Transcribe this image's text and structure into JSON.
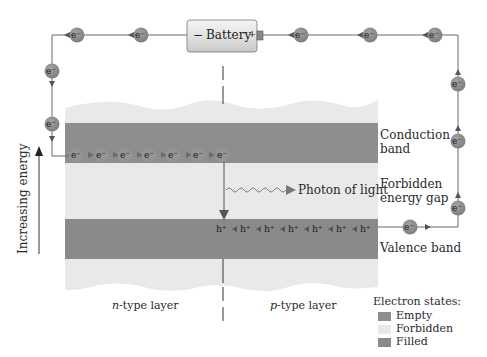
{
  "colors": {
    "empty_band": "#8e8e8e",
    "forbidden": "#e9e9e9",
    "filled_band": "#8a8a8a",
    "particle": "#8f8f8f",
    "wire": "#6a6a6a",
    "battery_body": "#e4e4e4"
  },
  "battery": {
    "label": "Battery",
    "negative": "−",
    "positive": "+"
  },
  "circuit": {
    "electron_symbol": "e⁻",
    "top_wire_electrons": 5,
    "left_wire_electrons": 2,
    "right_wire_electrons": 3,
    "valence_exit_electrons": 1
  },
  "bands": {
    "conduction": {
      "label_line1": "Conduction",
      "label_line2": "band",
      "electron_symbol": "e⁻",
      "electron_count": 7
    },
    "gap": {
      "label_line1": "Forbidden",
      "label_line2": "energy gap"
    },
    "valence": {
      "label": "Valence band",
      "hole_symbol": "h⁺",
      "hole_count": 7
    }
  },
  "photon": {
    "label": "Photon of light"
  },
  "axis": {
    "label": "Increasing energy"
  },
  "layers": {
    "n": {
      "italic": "n",
      "rest": "-type layer"
    },
    "p": {
      "italic": "p",
      "rest": "-type layer"
    }
  },
  "legend": {
    "title": "Electron states:",
    "items": [
      {
        "label": "Empty",
        "color": "#8e8e8e"
      },
      {
        "label": "Forbidden",
        "color": "#e9e9e9"
      },
      {
        "label": "Filled",
        "color": "#8a8a8a"
      }
    ]
  }
}
